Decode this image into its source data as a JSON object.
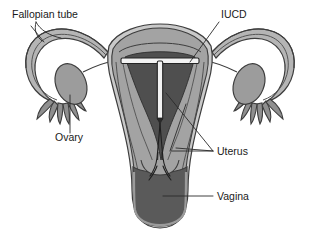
{
  "figure": {
    "background_color": "#ffffff",
    "width": 320,
    "height": 236
  },
  "palette": {
    "outline": "#3d3d3d",
    "myometrium": "#a3a3a3",
    "endometrial_cavity": "#4f4f4f",
    "serosa_light": "#c9c9c9",
    "tube_fill": "#b5b5b5",
    "tube_lumen": "#555555",
    "ovary_fill": "#9c9c9c",
    "vagina_fill": "#5a5a5a",
    "vagina_wall": "#bdbdbd",
    "iucd_device": "#f2f2f2",
    "label_text": "#1a1a1a",
    "leader_line": "#2a2a2a"
  },
  "labels": [
    {
      "id": "fallopian-tube",
      "text": "Fallopian tube",
      "x": 12,
      "y": 18,
      "anchor": "start"
    },
    {
      "id": "iucd",
      "text": "IUCD",
      "x": 221,
      "y": 18,
      "anchor": "start"
    },
    {
      "id": "ovary",
      "text": "Ovary",
      "x": 55,
      "y": 141,
      "anchor": "start"
    },
    {
      "id": "uterus",
      "text": "Uterus",
      "x": 217,
      "y": 155,
      "anchor": "start"
    },
    {
      "id": "vagina",
      "text": "Vagina",
      "x": 217,
      "y": 200,
      "anchor": "start"
    }
  ],
  "structures": [
    {
      "id": "fallopian-tube-left",
      "name": "Left fallopian tube"
    },
    {
      "id": "fallopian-tube-right",
      "name": "Right fallopian tube"
    },
    {
      "id": "fimbriae-left",
      "name": "Left fimbriae"
    },
    {
      "id": "fimbriae-right",
      "name": "Right fimbriae"
    },
    {
      "id": "ovary-left",
      "name": "Left ovary"
    },
    {
      "id": "ovary-right",
      "name": "Right ovary"
    },
    {
      "id": "uterus-body",
      "name": "Uterus"
    },
    {
      "id": "endometrial-cavity",
      "name": "Endometrial cavity"
    },
    {
      "id": "cervix",
      "name": "Cervix"
    },
    {
      "id": "vagina",
      "name": "Vagina"
    },
    {
      "id": "iucd-device",
      "name": "T-shaped intrauterine device"
    },
    {
      "id": "iucd-threads",
      "name": "IUCD retrieval threads"
    }
  ]
}
